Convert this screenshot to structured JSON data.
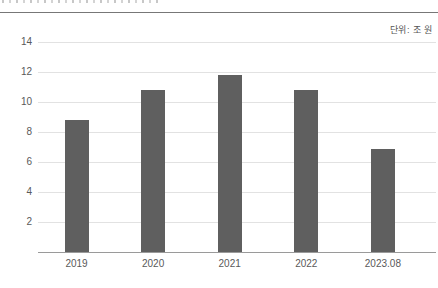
{
  "page": {
    "clipped_header_text_visible": true,
    "background_color": "#ffffff"
  },
  "chart_data": {
    "type": "bar",
    "title": "",
    "subtitle": "",
    "unit_label": "단위: 조 원",
    "categories": [
      "2019",
      "2020",
      "2021",
      "2022",
      "2023.08"
    ],
    "values": [
      8.8,
      10.8,
      11.8,
      10.8,
      6.9
    ],
    "xlabel": "",
    "ylabel": "",
    "ylim": [
      0,
      14
    ],
    "yticks": [
      2,
      4,
      6,
      8,
      10,
      12,
      14
    ],
    "grid": true,
    "legend": "none",
    "colors": {
      "bar": "#5f5f5f",
      "gridline": "#e2e2e2",
      "axis_line": "#9a9a9a",
      "top_rule": "#777777",
      "tick_text": "#595959"
    }
  }
}
